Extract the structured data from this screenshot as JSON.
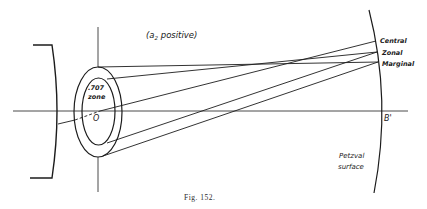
{
  "figure": {
    "caption": "Fig. 152.",
    "condition_label_open": "(a",
    "condition_label_sub": "2",
    "condition_label_close": " positive)",
    "labels": {
      "central": "Central",
      "zonal": "Zonal",
      "marginal": "Marginal",
      "image_point": "B'",
      "origin": "O",
      "zone_line1": ".707",
      "zone_line2": "zone",
      "petzval_line1": "Petzval",
      "petzval_line2": "surface"
    }
  }
}
